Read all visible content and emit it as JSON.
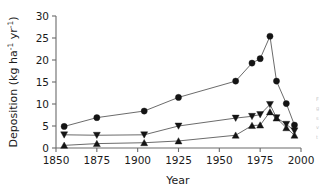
{
  "chart_data": {
    "type": "line",
    "title": "",
    "xlabel": "Year",
    "ylabel": "Deposition (kg ha-1 yr-1)",
    "ylabel_parts": {
      "main": "Deposition (kg ha",
      "sup1": "-1",
      "mid": " yr",
      "sup2": "-1",
      "tail": ")"
    },
    "xlim": [
      1850,
      2000
    ],
    "ylim": [
      0,
      30
    ],
    "xticks": [
      1850,
      1875,
      1900,
      1925,
      1950,
      1975,
      2000
    ],
    "yticks": [
      0,
      5,
      10,
      15,
      20,
      25,
      30
    ],
    "xtick_labels": [
      "1850",
      "1875",
      "1900",
      "1925",
      "1950",
      "1975",
      "2000"
    ],
    "ytick_labels": [
      "0",
      "5",
      "10",
      "15",
      "20",
      "25",
      "30"
    ],
    "grid": false,
    "legend": "none",
    "spines": [
      "left",
      "bottom"
    ],
    "series": [
      {
        "name": "circle-series",
        "marker": "circle",
        "color": "#141414",
        "x": [
          1855,
          1875,
          1904,
          1925,
          1960,
          1970,
          1975,
          1981,
          1985,
          1991,
          1996
        ],
        "values": [
          4.9,
          6.9,
          8.4,
          11.5,
          15.2,
          19.3,
          20.3,
          25.4,
          15.2,
          10.1,
          5.2
        ]
      },
      {
        "name": "down-triangle-series",
        "marker": "triangle-down",
        "color": "#141414",
        "x": [
          1855,
          1875,
          1904,
          1925,
          1960,
          1970,
          1975,
          1981,
          1985,
          1991,
          1996
        ],
        "values": [
          3.0,
          2.9,
          3.0,
          5.0,
          6.8,
          7.2,
          7.6,
          9.9,
          6.9,
          5.4,
          3.9
        ]
      },
      {
        "name": "up-triangle-series",
        "marker": "triangle-up",
        "color": "#141414",
        "x": [
          1855,
          1875,
          1904,
          1925,
          1960,
          1970,
          1975,
          1981,
          1985,
          1991,
          1996
        ],
        "values": [
          0.6,
          1.0,
          1.2,
          1.6,
          2.9,
          5.1,
          5.2,
          8.2,
          6.8,
          4.6,
          2.9
        ]
      }
    ]
  },
  "caption_fragment": {
    "lines": [
      "F",
      "g",
      "s",
      "v",
      "t"
    ]
  }
}
